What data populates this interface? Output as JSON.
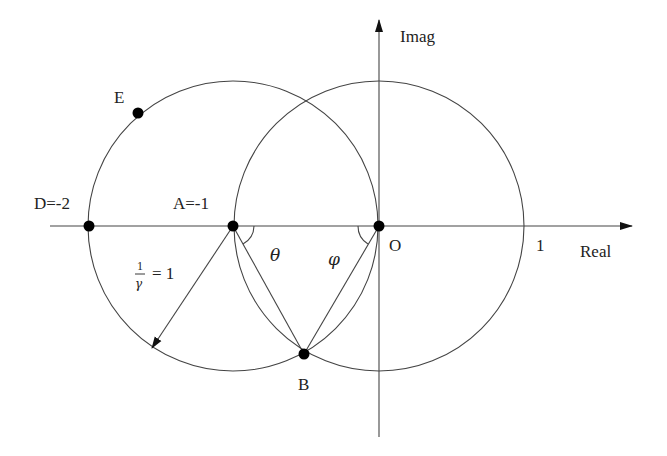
{
  "diagram": {
    "axes": {
      "real_label": "Real",
      "imag_label": "Imag",
      "tick_one_label": "1"
    },
    "points": {
      "D": "D=-2",
      "A": "A=-1",
      "O": "O",
      "B": "B",
      "E": "E"
    },
    "angles": {
      "theta": "θ",
      "phi": "φ"
    },
    "radius_label": {
      "numerator": "1",
      "denominator": "γ",
      "rhs": "= 1"
    },
    "colors": {
      "line": "#444444",
      "point": "#000000",
      "text": "#222222"
    }
  }
}
